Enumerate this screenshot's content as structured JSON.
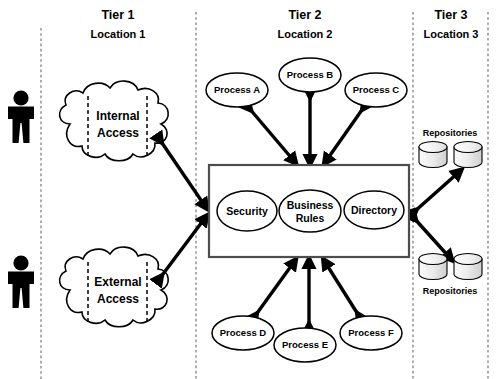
{
  "diagram": {
    "tiers": [
      {
        "id": "tier1",
        "name": "Tier 1",
        "location": "Location 1",
        "name_x": 118,
        "loc_x": 118
      },
      {
        "id": "tier2",
        "name": "Tier 2",
        "location": "Location 2",
        "name_x": 305,
        "loc_x": 305
      },
      {
        "id": "tier3",
        "name": "Tier 3",
        "location": "Location 3",
        "name_x": 451,
        "loc_x": 451
      }
    ],
    "dividers": [
      41,
      196,
      413,
      488
    ],
    "actors": [
      {
        "id": "actor-top",
        "label": "",
        "cx": 21,
        "cy": 120
      },
      {
        "id": "actor-bottom",
        "label": "",
        "cx": 21,
        "cy": 285
      }
    ],
    "clouds": [
      {
        "id": "internal-access",
        "line1": "Internal",
        "line2": "Access",
        "cx": 118,
        "cy": 124
      },
      {
        "id": "external-access",
        "line1": "External",
        "line2": "Access",
        "cx": 118,
        "cy": 290
      }
    ],
    "processes": [
      {
        "id": "process-a",
        "label": "Process A",
        "cx": 237,
        "cy": 90,
        "rx": 31,
        "ry": 17
      },
      {
        "id": "process-b",
        "label": "Process B",
        "cx": 310,
        "cy": 75,
        "rx": 31,
        "ry": 17
      },
      {
        "id": "process-c",
        "label": "Process C",
        "cx": 376,
        "cy": 90,
        "rx": 31,
        "ry": 17
      },
      {
        "id": "process-d",
        "label": "Process D",
        "cx": 243,
        "cy": 333,
        "rx": 31,
        "ry": 17
      },
      {
        "id": "process-e",
        "label": "Process E",
        "cx": 305,
        "cy": 345,
        "rx": 31,
        "ry": 17
      },
      {
        "id": "process-f",
        "label": "Process F",
        "cx": 371,
        "cy": 333,
        "rx": 31,
        "ry": 17
      }
    ],
    "core_box": {
      "x": 209,
      "y": 165,
      "width": 200,
      "height": 92
    },
    "core_services": [
      {
        "id": "security",
        "line1": "Security",
        "line2": "",
        "cx": 247,
        "cy": 211,
        "rx": 30,
        "ry": 20
      },
      {
        "id": "business-rules",
        "line1": "Business",
        "line2": "Rules",
        "cx": 310,
        "cy": 211,
        "rx": 31,
        "ry": 21
      },
      {
        "id": "directory",
        "line1": "Directory",
        "line2": "",
        "cx": 374,
        "cy": 210,
        "rx": 30,
        "ry": 19
      }
    ],
    "repositories": [
      {
        "id": "repo-group-top",
        "label": "Repositories",
        "label_x": 450,
        "label_y": 133,
        "cy": 152,
        "cylinders": [
          {
            "cx": 433
          },
          {
            "cx": 468
          }
        ]
      },
      {
        "id": "repo-group-bottom",
        "label": "Repositories",
        "label_x": 450,
        "label_y": 291,
        "cy": 262,
        "cylinders": [
          {
            "cx": 433
          },
          {
            "cx": 468
          }
        ]
      }
    ],
    "connections": [
      {
        "id": "conn-internal-to-core",
        "from": "internal-access",
        "to": "core-box",
        "kind": "bidirectional"
      },
      {
        "id": "conn-external-to-core",
        "from": "external-access",
        "to": "core-box",
        "kind": "bidirectional"
      },
      {
        "id": "conn-core-to-process-a",
        "from": "core-box",
        "to": "process-a",
        "kind": "bidirectional"
      },
      {
        "id": "conn-core-to-process-b",
        "from": "core-box",
        "to": "process-b",
        "kind": "bidirectional"
      },
      {
        "id": "conn-core-to-process-c",
        "from": "core-box",
        "to": "process-c",
        "kind": "bidirectional"
      },
      {
        "id": "conn-core-to-process-d",
        "from": "core-box",
        "to": "process-d",
        "kind": "bidirectional"
      },
      {
        "id": "conn-core-to-process-e",
        "from": "core-box",
        "to": "process-e",
        "kind": "bidirectional"
      },
      {
        "id": "conn-core-to-process-f",
        "from": "core-box",
        "to": "process-f",
        "kind": "bidirectional"
      },
      {
        "id": "conn-core-to-repo-top",
        "from": "core-box",
        "to": "repo-group-top",
        "kind": "bidirectional"
      },
      {
        "id": "conn-core-to-repo-bottom",
        "from": "core-box",
        "to": "repo-group-bottom",
        "kind": "bidirectional"
      }
    ],
    "colors": {
      "background": "#ffffff",
      "stroke": "#000000",
      "box_stroke": "#4d4d4d",
      "divider": "#8a8a8a",
      "cylinder_fill_light": "#f2f2f2",
      "cylinder_fill_dark": "#c9c9c9"
    }
  }
}
